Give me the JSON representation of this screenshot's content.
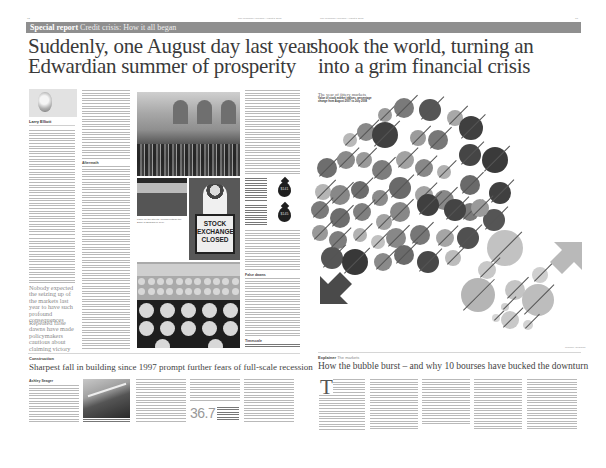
{
  "folios": {
    "left_page_number": "32",
    "left_masthead": "The Guardian | Tuesday August 5 2008",
    "right_masthead": "The Guardian | Tuesday August 5 2008",
    "right_page_number": "33"
  },
  "band": {
    "kicker": "Special report",
    "topic": "Credit crisis: How it all began"
  },
  "headline": {
    "left_line1": "Suddenly, one August day last year",
    "left_line2": "Edwardian summer of prosperity",
    "right_line1": "shook the world, turning an",
    "right_line2": "into a grim financial crisis"
  },
  "lead_article": {
    "author_name": "Larry Elliott",
    "author_role": "Economics editor",
    "subhead_1": "Aftermath",
    "subhead_2": "False dawns",
    "subhead_3": "Timescale",
    "pull_quote_1": "Nobody expected the seizing up of the markets last year to have such profound consequences",
    "pull_quote_2": "Repeated false dawns have made policymakers cautious about claiming victory"
  },
  "images": {
    "main_caption": "Panic on the streets: crowds outside the Bank of England in 1914",
    "photo2_label": "NORTHERN ROCK",
    "sign_text": [
      "STOCK",
      "EXCHANGE",
      "CLOSED"
    ],
    "sign_caption": "The Stock Exchange was closed in 1914 as war broke out"
  },
  "oil_drops": [
    {
      "value": "$141",
      "text": "Oil price peaked at record high in July"
    },
    {
      "value": "$145",
      "text": "Brent crude hit new high in mid-summer"
    }
  ],
  "construction": {
    "section": "Construction",
    "headline": "Sharpest fall in building since 1997 prompt further fears of full-scale recession",
    "author": "Ashley Seager",
    "stat_value": "36.7",
    "stat_text": "Percentage fall in house building orders in the second quarter",
    "photo_caption": "Building sites have fallen silent as orders dry up"
  },
  "chart": {
    "title": "The year of jittery markets",
    "subtitle": "Value of stock market indices, percentage change from August 2007 to July 2008",
    "credit": "Graphic: Guardian",
    "fallers_arrow": "down",
    "risers_arrow": "up"
  },
  "chart_data": {
    "type": "bubble",
    "title": "The year of jittery markets",
    "subtitle": "Value of stock market indices, percentage change from August 2007 to July 2008",
    "groups": [
      {
        "name": "Fallers",
        "direction": "down",
        "shade": "dark/mid grey",
        "count": 52
      },
      {
        "name": "Risers",
        "direction": "up",
        "shade": "light grey",
        "count": 10
      }
    ],
    "note": "Individual index labels are illegible at this resolution; bubble size encodes magnitude of percentage change"
  },
  "explainer": {
    "section": "Explainer",
    "topic": "The markets",
    "headline": "How the bubble burst – and why 10 bourses have bucked the downturn",
    "dropcap": "T",
    "byline": "Julia Kollewe"
  }
}
